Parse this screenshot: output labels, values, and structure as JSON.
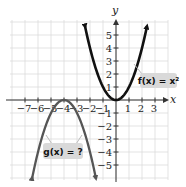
{
  "chart_data": {
    "type": "line",
    "title": "",
    "xlabel": "x",
    "ylabel": "y",
    "xlim": [
      -8,
      4
    ],
    "ylim": [
      -6,
      6
    ],
    "grid": true,
    "x_ticks": [
      -7,
      -6,
      -5,
      -4,
      -3,
      -2,
      -1,
      1,
      2,
      3
    ],
    "y_ticks": [
      -5,
      -4,
      -3,
      -2,
      -1,
      1,
      2,
      3,
      4,
      5
    ],
    "x_tick_labels": [
      "−7",
      "−6",
      "−5",
      "−4",
      "−3",
      "−2",
      "−1",
      "1",
      "2",
      "3"
    ],
    "y_tick_labels": [
      "−5",
      "−4",
      "−3",
      "−2",
      "−1",
      "1",
      "2",
      "3",
      "4",
      "5"
    ],
    "series": [
      {
        "name": "f(x) = x²",
        "label": "f(x) = x²",
        "color": "#111111",
        "expression": "x^2",
        "x": [
          -2.4,
          -2,
          -1.5,
          -1,
          -0.5,
          0,
          0.5,
          1,
          1.5,
          2,
          2.4
        ],
        "y": [
          5.76,
          4,
          2.25,
          1,
          0.25,
          0,
          0.25,
          1,
          2.25,
          4,
          5.76
        ]
      },
      {
        "name": "g(x) = ?",
        "label": "g(x) = ?",
        "color": "#555555",
        "expression": "-(x+4)^2",
        "x": [
          -6.45,
          -6,
          -5.5,
          -5,
          -4.5,
          -4,
          -3.5,
          -3,
          -2.5,
          -2,
          -1.55
        ],
        "y": [
          -6,
          -4,
          -2.25,
          -1,
          -0.25,
          0,
          -0.25,
          -1,
          -2.25,
          -4,
          -6
        ]
      }
    ]
  },
  "labels": {
    "x_axis": "x",
    "y_axis": "y",
    "f_label": "f(x) = x²",
    "g_label": "g(x) = ?"
  }
}
